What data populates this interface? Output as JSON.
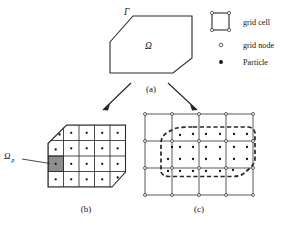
{
  "figure": {
    "caption_a": "(a)",
    "caption_b": "(b)",
    "caption_c": "(c)",
    "boundary_label": "Γ",
    "domain_label": "Ω",
    "subdomain_label": "Ω",
    "subdomain_subscript": "p",
    "watermark_text": ""
  },
  "legend": {
    "items": [
      {
        "icon": "grid-cell-icon",
        "label": "grid cell"
      },
      {
        "icon": "grid-node-icon",
        "label": "grid node"
      },
      {
        "icon": "particle-icon",
        "label": "Particle"
      }
    ]
  },
  "colors": {
    "line": "#2b2b2b",
    "grid": "#4a4a4a",
    "shaded_cell": "#8e8e8e",
    "particle": "#111111",
    "node_fill": "#ffffff",
    "dashed": "#262626",
    "background": "#fefefe"
  },
  "panel_a": {
    "name": "continuum-body",
    "polygon_points": "110,42 133,16 192,16 192,58 173,73 110,73",
    "label_gamma_x": 124,
    "label_gamma_y": 14,
    "label_omega_x": 147,
    "label_omega_y": 48
  },
  "panel_b": {
    "name": "material-grid",
    "cols": 5,
    "rows": 4,
    "cell_size": 15.5,
    "origin_x": 48,
    "origin_y": 125,
    "clip_polygon": "48,143 66,125 125.5,125 125.5,172 113,187 48,187",
    "shaded_cell": {
      "col": 0,
      "row": 2
    },
    "particle_count": 22,
    "leader_from": {
      "x": 20,
      "y": 160
    },
    "leader_to": {
      "x": 50,
      "y": 163
    },
    "label_x": 4,
    "label_y": 160
  },
  "panel_c": {
    "name": "background-grid-with-particles",
    "cols": 4,
    "rows": 3,
    "cell_size": 27,
    "origin_x": 145,
    "origin_y": 113,
    "dashed_outline": "196,128 250,128 256,132 256,160 252,168 240,177 186,177 160,177 160,165 160,140 168,131 180,128 190,128",
    "particle_count": 24,
    "node_count": 20
  },
  "arrows": [
    {
      "name": "arrow-a-to-b",
      "x1": 130,
      "y1": 85,
      "x2": 101,
      "y2": 112
    },
    {
      "name": "arrow-a-to-c",
      "x1": 168,
      "y1": 85,
      "x2": 199,
      "y2": 112
    }
  ]
}
